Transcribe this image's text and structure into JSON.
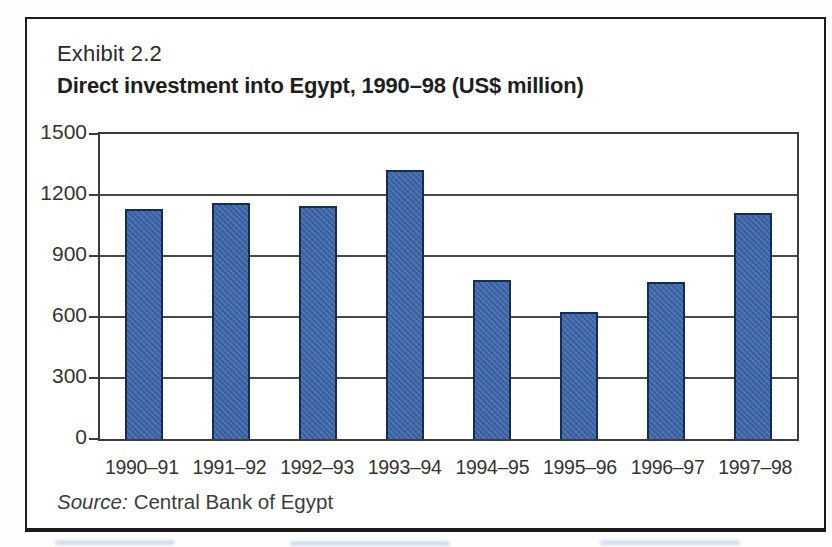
{
  "exhibit": {
    "label": "Exhibit 2.2",
    "title": "Direct investment into Egypt, 1990–98 (US$ million)"
  },
  "source": {
    "prefix": "Source:",
    "text": "Central Bank of Egypt"
  },
  "chart_data": {
    "type": "bar",
    "title": "Direct investment into Egypt, 1990–98 (US$ million)",
    "categories": [
      "1990–91",
      "1991–92",
      "1992–93",
      "1993–94",
      "1994–95",
      "1995–96",
      "1996–97",
      "1997–98"
    ],
    "values": [
      1130,
      1160,
      1145,
      1325,
      780,
      625,
      770,
      1110
    ],
    "xlabel": "",
    "ylabel": "",
    "ylim": [
      0,
      1500
    ],
    "yticks": [
      0,
      300,
      600,
      900,
      1200,
      1500
    ],
    "grid": true,
    "legend": "none",
    "bar_color": "#446fb1",
    "bar_border_color": "#142c58",
    "source_note": "Source: Central Bank of Egypt"
  }
}
